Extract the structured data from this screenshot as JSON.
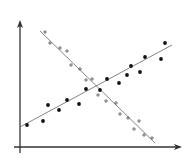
{
  "chart_data": {
    "type": "scatter",
    "title": "",
    "xlabel": "",
    "ylabel": "",
    "grid": false,
    "legend": null,
    "axes": {
      "x_axis": {
        "x1": 14,
        "y1": 147,
        "x2": 182,
        "y2": 147,
        "arrow": true
      },
      "y_axis": {
        "x1": 20,
        "y1": 153,
        "x2": 20,
        "y2": 20,
        "arrow": true
      },
      "color": "#333333"
    },
    "series": [
      {
        "name": "dots",
        "marker": "dot",
        "color": "#111111",
        "trend": "positive",
        "points": [
          [
            27,
            125
          ],
          [
            43,
            121
          ],
          [
            48,
            105
          ],
          [
            59,
            110
          ],
          [
            67,
            100
          ],
          [
            79,
            104
          ],
          [
            86,
            89
          ],
          [
            100,
            90
          ],
          [
            107,
            79
          ],
          [
            119,
            83
          ],
          [
            127,
            75
          ],
          [
            131,
            66
          ],
          [
            140,
            72
          ],
          [
            145,
            57
          ],
          [
            161,
            59
          ],
          [
            165,
            43
          ]
        ],
        "fit_line": {
          "x1": 20,
          "y1": 127,
          "x2": 172,
          "y2": 45
        }
      },
      {
        "name": "crosses",
        "marker": "plus",
        "color": "#555555",
        "trend": "negative",
        "points": [
          [
            45,
            32
          ],
          [
            50,
            43
          ],
          [
            60,
            48
          ],
          [
            67,
            51
          ],
          [
            71,
            65
          ],
          [
            80,
            69
          ],
          [
            86,
            80
          ],
          [
            92,
            79
          ],
          [
            98,
            95
          ],
          [
            106,
            101
          ],
          [
            116,
            103
          ],
          [
            120,
            114
          ],
          [
            128,
            118
          ],
          [
            134,
            129
          ],
          [
            139,
            121
          ],
          [
            144,
            135
          ],
          [
            152,
            138
          ]
        ],
        "fit_line": {
          "x1": 40,
          "y1": 31,
          "x2": 155,
          "y2": 143
        }
      }
    ]
  }
}
